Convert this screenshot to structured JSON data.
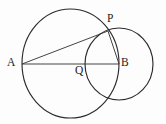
{
  "figure": {
    "type": "geometry-diagram",
    "canvas": {
      "width": 166,
      "height": 124,
      "background": "#fdfdfd"
    },
    "stroke_color": "#2b2b2b",
    "segment_color": "#3a3a3a",
    "label_color": "#1c1c1c",
    "labels": {
      "a": "A",
      "p": "P",
      "q": "Q",
      "b": "B"
    },
    "points": [
      {
        "name": "A",
        "label": "A",
        "x": 22,
        "y": 64
      },
      {
        "name": "Q",
        "label": "Q",
        "x": 85,
        "y": 64
      },
      {
        "name": "B",
        "label": "B",
        "x": 119,
        "y": 64
      },
      {
        "name": "P",
        "label": "P",
        "x": 108,
        "y": 31
      }
    ],
    "circles": [
      {
        "name": "large-circle",
        "cx": 70.5,
        "cy": 63.5,
        "rx": 48.5,
        "ry": 54.5
      },
      {
        "name": "small-circle",
        "cx": 119,
        "cy": 64,
        "rx": 34,
        "ry": 36
      }
    ],
    "segments": [
      {
        "name": "segment-AP",
        "x1": 22,
        "y1": 64,
        "x2": 108,
        "y2": 31
      },
      {
        "name": "segment-AB",
        "x1": 22,
        "y1": 64,
        "x2": 119,
        "y2": 64
      },
      {
        "name": "segment-PB",
        "x1": 108,
        "y1": 31,
        "x2": 119,
        "y2": 64
      }
    ]
  }
}
